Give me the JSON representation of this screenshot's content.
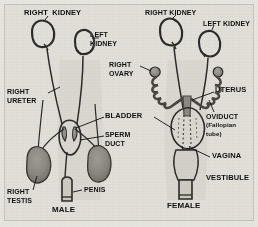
{
  "figure": {
    "title_present": false,
    "background_color": "#e3e1da",
    "ink_color": "#2b2b2b",
    "organ_fill_color": "#8d8a84",
    "width": 258,
    "height": 227
  },
  "panels": {
    "male": {
      "caption": "MALE",
      "labels": {
        "right_kidney": "RIGHT  KIDNEY",
        "left_kidney_line1": "LEFT",
        "left_kidney_line2": "KIDNEY",
        "right_ureter_line1": "RIGHT",
        "right_ureter_line2": "URETER",
        "bladder": "BLADDER",
        "sperm_duct_line1": "SPERM",
        "sperm_duct_line2": "DUCT",
        "right_testis_line1": "RIGHT",
        "right_testis_line2": "TESTIS",
        "penis": "PENIS"
      }
    },
    "female": {
      "caption": "FEMALE",
      "labels": {
        "right_kidney": "RIGHT KIDNEY",
        "left_kidney": "LEFT KIDNEY",
        "right_ovary_line1": "RIGHT",
        "right_ovary_line2": "OVARY",
        "uterus": "UTERUS",
        "oviduct_line1": "OVIDUCT",
        "oviduct_line2": "(Fallopian",
        "oviduct_line3": "tube)",
        "vagina": "VAGINA",
        "vestibule": "VESTIBULE"
      }
    }
  }
}
